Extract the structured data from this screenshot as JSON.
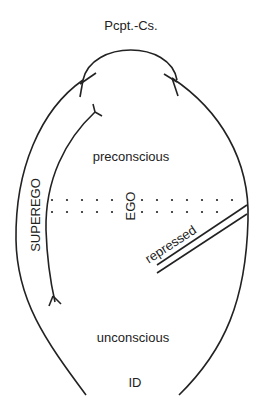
{
  "diagram": {
    "type": "freud-structural-model",
    "colors": {
      "stroke": "#222222",
      "background": "#ffffff"
    },
    "labels": {
      "perception_consciousness": "Pcpt.-Cs.",
      "preconscious": "preconscious",
      "superego": "SUPEREGO",
      "ego": "EGO",
      "repressed": "repressed",
      "unconscious": "unconscious",
      "id": "ID"
    },
    "regions": [
      {
        "name": "perception-consciousness",
        "label": "Pcpt.-Cs.",
        "position": "top"
      },
      {
        "name": "preconscious",
        "label": "preconscious",
        "position": "upper-middle"
      },
      {
        "name": "superego",
        "label": "SUPEREGO",
        "position": "left-band",
        "orientation": "vertical"
      },
      {
        "name": "ego",
        "label": "EGO",
        "position": "center",
        "orientation": "vertical"
      },
      {
        "name": "repressed",
        "label": "repressed",
        "position": "right-diagonal",
        "orientation": "diagonal"
      },
      {
        "name": "unconscious",
        "label": "unconscious",
        "position": "lower-middle"
      },
      {
        "name": "id",
        "label": "ID",
        "position": "bottom"
      }
    ],
    "boundaries": {
      "dotted_lines": 2,
      "repressed_barrier": "double-line"
    }
  }
}
